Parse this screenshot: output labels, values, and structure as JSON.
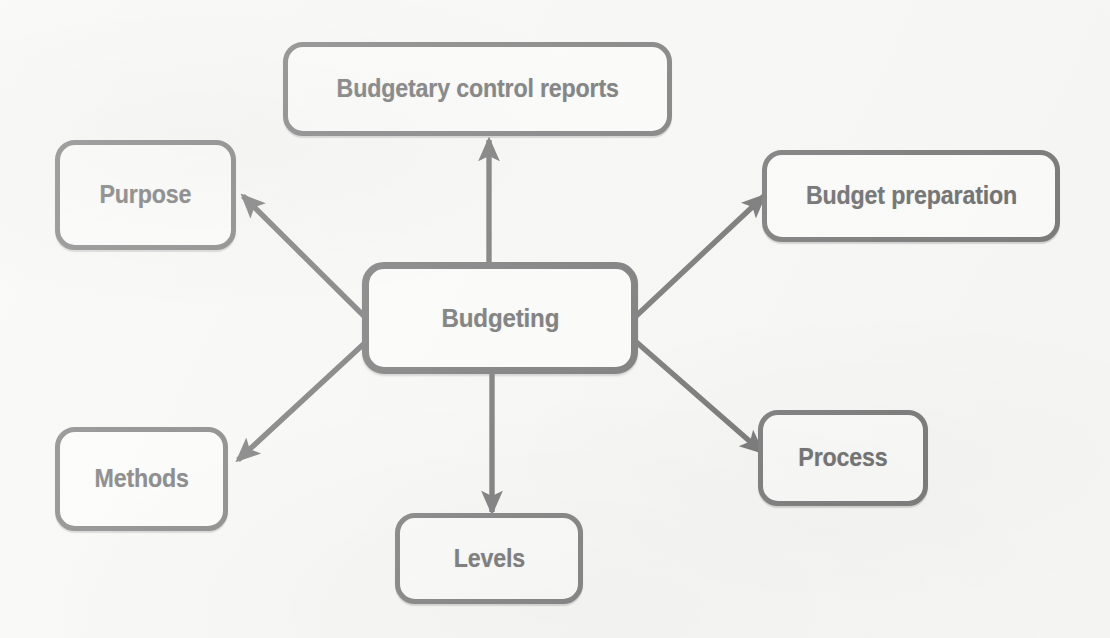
{
  "diagram": {
    "title": "Budgeting",
    "type": "mind-map",
    "colors": {
      "background": "#f7f7f5",
      "node_fill": "#fbfbfa",
      "node_border": "#757575",
      "hub_border": "#707070",
      "text": "#696969",
      "arrow": "#6e6e6e"
    },
    "center": {
      "id": "budgeting",
      "label": "Budgeting"
    },
    "nodes": [
      {
        "id": "reports",
        "label": "Budgetary control reports"
      },
      {
        "id": "purpose",
        "label": "Purpose"
      },
      {
        "id": "preparation",
        "label": "Budget preparation"
      },
      {
        "id": "methods",
        "label": "Methods"
      },
      {
        "id": "process",
        "label": "Process"
      },
      {
        "id": "levels",
        "label": "Levels"
      }
    ],
    "connections": [
      {
        "from": "budgeting",
        "to": "reports",
        "direction": "up",
        "arrowhead": "target"
      },
      {
        "from": "budgeting",
        "to": "purpose",
        "direction": "up-left",
        "arrowhead": "target"
      },
      {
        "from": "budgeting",
        "to": "preparation",
        "direction": "up-right",
        "arrowhead": "target"
      },
      {
        "from": "budgeting",
        "to": "methods",
        "direction": "down-left",
        "arrowhead": "target"
      },
      {
        "from": "budgeting",
        "to": "process",
        "direction": "down-right",
        "arrowhead": "target"
      },
      {
        "from": "budgeting",
        "to": "levels",
        "direction": "down",
        "arrowhead": "target"
      }
    ]
  }
}
